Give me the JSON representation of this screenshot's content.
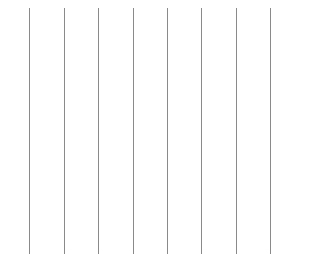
{
  "canvas": {
    "width": 298,
    "height": 257,
    "background": "#ffffff"
  },
  "lines": {
    "color": "#8a8a8a",
    "top": 8,
    "bottom": 254,
    "x_positions": [
      29,
      64,
      98,
      133,
      167,
      201,
      236,
      270
    ]
  }
}
